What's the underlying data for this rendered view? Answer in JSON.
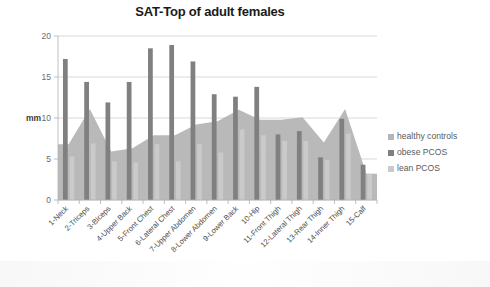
{
  "chart_data": {
    "type": "bar",
    "title": "SAT-Top of adult females",
    "xlabel": "",
    "ylabel": "mm",
    "ylim": [
      0,
      20
    ],
    "yticks": [
      0,
      5,
      10,
      15,
      20
    ],
    "grid": true,
    "legend_position": "right",
    "categories": [
      "1-Neck",
      "2-Triceps",
      "3-Biceps",
      "4-Upper Back",
      "5-Front Chest",
      "6-Lateral Chest",
      "7-Upper Abdomen",
      "8-Lower Abdomen",
      "9-Lower Back",
      "10-Hip",
      "11-Front Thigh",
      "12-Lateral Thigh",
      "13-Rear Thigh",
      "14-Inner Thigh",
      "15-Calf"
    ],
    "series": [
      {
        "name": "healthy controls",
        "render": "area",
        "color": "#b5b5b5",
        "values": [
          6.8,
          11.1,
          5.9,
          6.3,
          7.9,
          7.9,
          9.2,
          9.6,
          11.0,
          9.8,
          9.8,
          10.1,
          7.0,
          11.1,
          3.2
        ]
      },
      {
        "name": "obese PCOS",
        "render": "bar",
        "color": "#808080",
        "values": [
          17.2,
          14.4,
          11.9,
          14.4,
          18.5,
          18.9,
          16.9,
          12.9,
          12.6,
          13.8,
          8.0,
          8.4,
          5.2,
          9.9,
          4.3
        ]
      },
      {
        "name": "lean PCOS",
        "render": "bar",
        "color": "#cacaca",
        "values": [
          5.3,
          6.9,
          4.7,
          4.6,
          6.8,
          4.7,
          6.8,
          5.8,
          8.6,
          7.9,
          7.2,
          7.2,
          4.9,
          8.1,
          3.2
        ]
      }
    ]
  },
  "axis": {
    "y_title": "mm",
    "y_ticks": [
      "0",
      "5",
      "10",
      "15",
      "20"
    ]
  },
  "legend": {
    "items": [
      {
        "label": "healthy controls",
        "color": "#b5b5b5"
      },
      {
        "label": "obese PCOS",
        "color": "#808080"
      },
      {
        "label": "lean PCOS",
        "color": "#cacaca"
      }
    ]
  }
}
